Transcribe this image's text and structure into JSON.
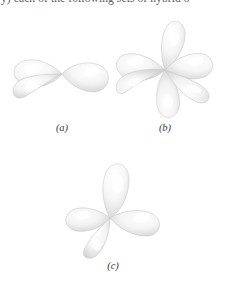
{
  "page": {
    "background_color": "#ffffff",
    "width": 225,
    "height": 283,
    "top_text_clipped": "y) each of the following sets of hybrid o"
  },
  "figure": {
    "lobe_color": "#fbfbfb",
    "lobe_shade_color": "#d9d9d9",
    "lobe_highlight_color": "#ffffff",
    "lobe_outline_color": "#cfcfcf",
    "panels": [
      {
        "id": "panel-a",
        "caption": "(a)",
        "orbital_type": "sp",
        "lobe_count": 3,
        "description": "two overlapping lobes to the left and one lobe to the right",
        "lobes": [
          {
            "name": "lobe-upper-left",
            "angle": 196,
            "length": 46,
            "width": 30
          },
          {
            "name": "lobe-lower-left",
            "angle": 214,
            "length": 44,
            "width": 28
          },
          {
            "name": "lobe-right",
            "angle": 2,
            "length": 48,
            "width": 27
          }
        ]
      },
      {
        "id": "panel-b",
        "caption": "(b)",
        "orbital_type": "sp3d2",
        "lobe_count": 6,
        "description": "six lobes radiating from a central point",
        "lobes": [
          {
            "name": "lobe-up",
            "angle": 272,
            "length": 50,
            "width": 26
          },
          {
            "name": "lobe-down",
            "angle": 92,
            "length": 50,
            "width": 26
          },
          {
            "name": "lobe-upper-left",
            "angle": 196,
            "length": 46,
            "width": 26
          },
          {
            "name": "lobe-lower-left",
            "angle": 216,
            "length": 42,
            "width": 26
          },
          {
            "name": "lobe-upper-right",
            "angle": 340,
            "length": 46,
            "width": 26
          },
          {
            "name": "lobe-lower-right",
            "angle": 18,
            "length": 46,
            "width": 26
          }
        ]
      },
      {
        "id": "panel-c",
        "caption": "(c)",
        "orbital_type": "sp3",
        "lobe_count": 4,
        "description": "tetrahedral arrangement with one lobe up, one right, one left and one toward the viewer",
        "lobes": [
          {
            "name": "lobe-up",
            "angle": 271,
            "length": 56,
            "width": 30
          },
          {
            "name": "lobe-right",
            "angle": 16,
            "length": 50,
            "width": 28
          },
          {
            "name": "lobe-left",
            "angle": 196,
            "length": 42,
            "width": 27
          },
          {
            "name": "lobe-front-down",
            "angle": 118,
            "length": 46,
            "width": 28
          }
        ]
      }
    ]
  }
}
